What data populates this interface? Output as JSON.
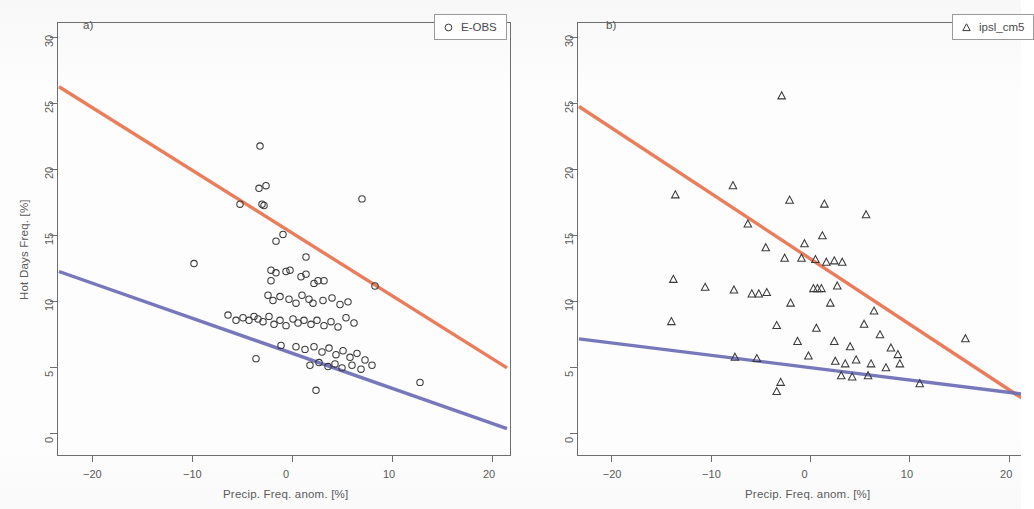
{
  "figure": {
    "background": "#fdfdfd",
    "axis_color": "#6e6e6e",
    "marker_color": "#3a3a3a",
    "line_orange": "#E8734E",
    "line_blue": "#6C6CB6"
  },
  "axes": {
    "xlabel": "Precip. Freq. anom. [%]",
    "ylabel": "Hot Days Freq. [%]",
    "xticks": [
      "-20",
      "-10",
      "0",
      "10",
      "20"
    ],
    "yticks": [
      "0",
      "5",
      "10",
      "15",
      "20",
      "25",
      "30"
    ],
    "xlim": [
      -23.5,
      21.8
    ],
    "ylim": [
      -1.6,
      31.2
    ]
  },
  "panels": [
    {
      "tag": "a)",
      "legend_label": "E-OBS",
      "legend_marker": "circle-marker-icon"
    },
    {
      "tag": "b)",
      "legend_label": "ipsl_cm5",
      "legend_marker": "triangle-marker-icon"
    }
  ],
  "chart_data": [
    {
      "type": "scatter",
      "panel": "a)",
      "title": "",
      "xlabel": "Precip. Freq. anom. [%]",
      "ylabel": "Hot Days Freq. [%]",
      "xlim": [
        -23.5,
        21.8
      ],
      "ylim": [
        -1.6,
        31.2
      ],
      "xticks": [
        -20,
        -10,
        0,
        10,
        20
      ],
      "yticks": [
        0,
        5,
        10,
        15,
        20,
        25,
        30
      ],
      "grid": false,
      "legend": {
        "position": "top-right",
        "entries": [
          "E-OBS"
        ]
      },
      "series": [
        {
          "name": "E-OBS",
          "marker": "open-circle",
          "points": [
            [
              -3.2,
              21.8
            ],
            [
              -5.2,
              17.4
            ],
            [
              -3.3,
              18.6
            ],
            [
              -2.6,
              18.8
            ],
            [
              -3.0,
              17.4
            ],
            [
              -2.8,
              17.3
            ],
            [
              7.0,
              17.8
            ],
            [
              -1.6,
              14.6
            ],
            [
              -0.9,
              15.1
            ],
            [
              1.4,
              13.4
            ],
            [
              -9.8,
              12.9
            ],
            [
              -2.1,
              12.4
            ],
            [
              -1.6,
              12.2
            ],
            [
              -2.1,
              11.6
            ],
            [
              -0.6,
              12.3
            ],
            [
              -0.2,
              12.4
            ],
            [
              0.9,
              11.9
            ],
            [
              1.4,
              12.1
            ],
            [
              2.2,
              11.4
            ],
            [
              2.6,
              11.6
            ],
            [
              3.2,
              11.6
            ],
            [
              8.3,
              11.2
            ],
            [
              -2.4,
              10.5
            ],
            [
              -1.9,
              10.1
            ],
            [
              -1.2,
              10.4
            ],
            [
              -0.3,
              10.2
            ],
            [
              0.4,
              9.9
            ],
            [
              1.0,
              10.5
            ],
            [
              1.7,
              10.2
            ],
            [
              2.1,
              9.9
            ],
            [
              3.1,
              10.1
            ],
            [
              4.0,
              10.3
            ],
            [
              4.8,
              9.8
            ],
            [
              5.6,
              10.0
            ],
            [
              -6.4,
              9.0
            ],
            [
              -5.6,
              8.6
            ],
            [
              -4.9,
              8.8
            ],
            [
              -4.3,
              8.6
            ],
            [
              -3.8,
              8.9
            ],
            [
              -3.4,
              8.7
            ],
            [
              -2.9,
              8.5
            ],
            [
              -2.3,
              8.9
            ],
            [
              -1.8,
              8.3
            ],
            [
              -1.2,
              8.6
            ],
            [
              -0.6,
              8.2
            ],
            [
              0.1,
              8.7
            ],
            [
              0.6,
              8.4
            ],
            [
              1.2,
              8.6
            ],
            [
              1.9,
              8.3
            ],
            [
              2.5,
              8.6
            ],
            [
              3.2,
              8.2
            ],
            [
              3.9,
              8.5
            ],
            [
              4.6,
              8.1
            ],
            [
              5.4,
              8.8
            ],
            [
              6.2,
              8.4
            ],
            [
              -1.1,
              6.7
            ],
            [
              0.4,
              6.6
            ],
            [
              1.3,
              6.4
            ],
            [
              2.2,
              6.6
            ],
            [
              3.0,
              6.2
            ],
            [
              3.7,
              6.5
            ],
            [
              4.4,
              6.0
            ],
            [
              5.1,
              6.3
            ],
            [
              5.8,
              5.8
            ],
            [
              6.5,
              6.1
            ],
            [
              7.3,
              5.6
            ],
            [
              -3.6,
              5.7
            ],
            [
              1.8,
              5.2
            ],
            [
              2.7,
              5.4
            ],
            [
              3.6,
              5.1
            ],
            [
              4.3,
              5.3
            ],
            [
              5.0,
              5.0
            ],
            [
              6.0,
              5.2
            ],
            [
              6.9,
              4.9
            ],
            [
              8.0,
              5.2
            ],
            [
              2.4,
              3.3
            ],
            [
              12.8,
              3.9
            ]
          ]
        },
        {
          "name": "regression-upper",
          "type": "line",
          "color": "#E8734E",
          "endpoints": [
            [
              -23.3,
              26.3
            ],
            [
              21.5,
              5.0
            ]
          ]
        },
        {
          "name": "regression-lower",
          "type": "line",
          "color": "#6C6CB6",
          "endpoints": [
            [
              -23.3,
              12.3
            ],
            [
              21.5,
              0.4
            ]
          ]
        }
      ]
    },
    {
      "type": "scatter",
      "panel": "b)",
      "title": "",
      "xlabel": "Precip. Freq. anom. [%]",
      "ylabel": "Hot Days Freq. [%]",
      "xlim": [
        -23.5,
        21.8
      ],
      "ylim": [
        -1.6,
        31.2
      ],
      "xticks": [
        -20,
        -10,
        0,
        10,
        20
      ],
      "yticks": [
        0,
        5,
        10,
        15,
        20,
        25,
        30
      ],
      "grid": false,
      "legend": {
        "position": "top-right",
        "entries": [
          "ipsl_cm5"
        ]
      },
      "series": [
        {
          "name": "ipsl_cm5",
          "marker": "open-triangle",
          "points": [
            [
              -2.9,
              25.6
            ],
            [
              -13.6,
              18.1
            ],
            [
              -7.8,
              18.8
            ],
            [
              -2.1,
              17.7
            ],
            [
              1.4,
              17.4
            ],
            [
              5.6,
              16.6
            ],
            [
              -6.3,
              15.9
            ],
            [
              -4.5,
              14.1
            ],
            [
              -0.6,
              14.4
            ],
            [
              1.2,
              15.0
            ],
            [
              -2.6,
              13.3
            ],
            [
              -0.9,
              13.3
            ],
            [
              0.5,
              13.2
            ],
            [
              1.6,
              13.0
            ],
            [
              2.4,
              13.1
            ],
            [
              3.2,
              13.0
            ],
            [
              -13.8,
              11.7
            ],
            [
              -10.6,
              11.1
            ],
            [
              -7.7,
              10.9
            ],
            [
              -5.9,
              10.6
            ],
            [
              -5.2,
              10.6
            ],
            [
              -4.4,
              10.7
            ],
            [
              0.3,
              11.0
            ],
            [
              0.7,
              11.0
            ],
            [
              1.1,
              11.0
            ],
            [
              2.7,
              11.2
            ],
            [
              -14.0,
              8.5
            ],
            [
              -3.4,
              8.2
            ],
            [
              -1.3,
              7.0
            ],
            [
              0.6,
              8.0
            ],
            [
              2.4,
              7.0
            ],
            [
              4.0,
              6.6
            ],
            [
              5.4,
              8.3
            ],
            [
              7.0,
              7.5
            ],
            [
              8.1,
              6.5
            ],
            [
              -0.2,
              5.9
            ],
            [
              2.5,
              5.5
            ],
            [
              3.5,
              5.3
            ],
            [
              4.6,
              5.6
            ],
            [
              6.1,
              5.3
            ],
            [
              7.6,
              5.0
            ],
            [
              8.8,
              6.0
            ],
            [
              9.0,
              5.3
            ],
            [
              3.1,
              4.4
            ],
            [
              4.2,
              4.3
            ],
            [
              5.8,
              4.4
            ],
            [
              -3.0,
              3.9
            ],
            [
              -3.4,
              3.2
            ],
            [
              -7.6,
              5.8
            ],
            [
              -5.4,
              5.7
            ],
            [
              11.0,
              3.8
            ],
            [
              15.6,
              7.2
            ],
            [
              2.0,
              9.9
            ],
            [
              -2.0,
              9.9
            ],
            [
              6.4,
              9.3
            ]
          ]
        },
        {
          "name": "regression-upper",
          "type": "line",
          "color": "#E8734E",
          "endpoints": [
            [
              -23.3,
              24.8
            ],
            [
              21.5,
              2.6
            ]
          ]
        },
        {
          "name": "regression-lower",
          "type": "line",
          "color": "#6C6CB6",
          "endpoints": [
            [
              -23.3,
              7.2
            ],
            [
              21.5,
              3.0
            ]
          ]
        }
      ]
    }
  ]
}
